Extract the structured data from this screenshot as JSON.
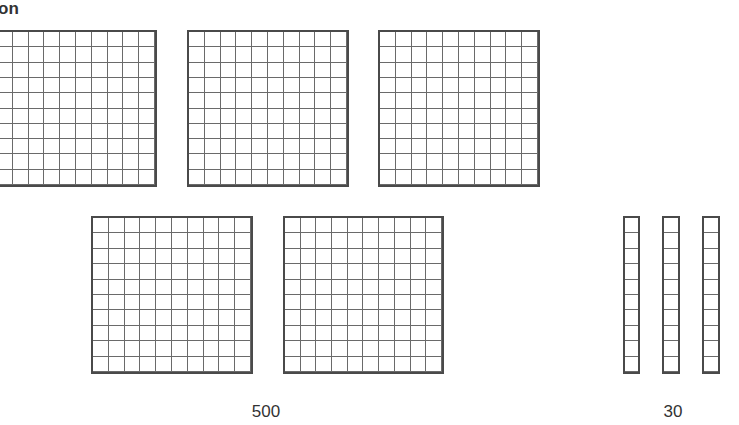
{
  "heading": {
    "text": "on"
  },
  "diagram": {
    "type": "base-ten-blocks",
    "colors": {
      "line": "#4a4a4a",
      "inner_line": "#6a6a6a",
      "background": "#ffffff",
      "text": "#333333"
    },
    "flats": {
      "count": 5,
      "grid": "10x10",
      "value_each": 100,
      "label": "500"
    },
    "rods": {
      "count": 3,
      "cells": 10,
      "value_each": 10,
      "label": "30"
    }
  }
}
